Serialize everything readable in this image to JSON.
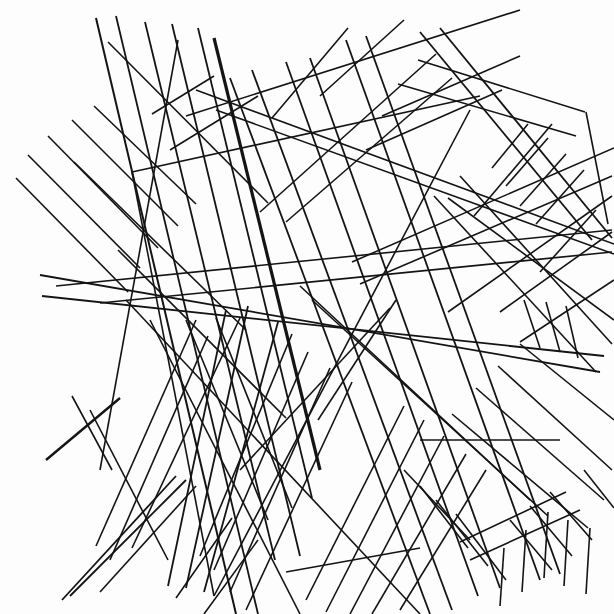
{
  "artwork": {
    "title": "Abstract Straight-Line Composition",
    "medium": "line-drawing",
    "width": 614,
    "height": 614,
    "background_color": "#fdfdfd",
    "stroke_color": "#141414",
    "description": "Dense abstract composition of straight black line segments forming overlapping parallel bundles at many angles on a white field."
  },
  "chart_data": {
    "type": "scatter",
    "xlabel": "",
    "ylabel": "",
    "xlim": [
      0,
      614
    ],
    "ylim": [
      0,
      614
    ],
    "grid": false,
    "legend": "none",
    "segments": [
      {
        "id": "s001",
        "x1": 108,
        "y1": 42,
        "x2": 268,
        "y2": 203,
        "w": 1.6,
        "group": "ul-fan"
      },
      {
        "id": "s002",
        "x1": 94,
        "y1": 106,
        "x2": 196,
        "y2": 204,
        "w": 1.6,
        "group": "ul-fan"
      },
      {
        "id": "s003",
        "x1": 72,
        "y1": 120,
        "x2": 178,
        "y2": 226,
        "w": 1.6,
        "group": "ul-fan"
      },
      {
        "id": "s004",
        "x1": 48,
        "y1": 136,
        "x2": 158,
        "y2": 248,
        "w": 1.6,
        "group": "ul-fan"
      },
      {
        "id": "s005",
        "x1": 28,
        "y1": 155,
        "x2": 140,
        "y2": 268,
        "w": 1.6,
        "group": "ul-fan"
      },
      {
        "id": "s006",
        "x1": 16,
        "y1": 178,
        "x2": 128,
        "y2": 292,
        "w": 1.6,
        "group": "ul-fan"
      },
      {
        "id": "s010",
        "x1": 96,
        "y1": 18,
        "x2": 236,
        "y2": 614,
        "w": 2.0,
        "group": "ul-bundle"
      },
      {
        "id": "s011",
        "x1": 116,
        "y1": 16,
        "x2": 258,
        "y2": 614,
        "w": 1.8,
        "group": "ul-bundle"
      },
      {
        "id": "s012",
        "x1": 145,
        "y1": 22,
        "x2": 275,
        "y2": 560,
        "w": 1.8,
        "group": "ul-bundle"
      },
      {
        "id": "s013",
        "x1": 172,
        "y1": 24,
        "x2": 300,
        "y2": 556,
        "w": 1.8,
        "group": "ul-bundle"
      },
      {
        "id": "s014",
        "x1": 198,
        "y1": 28,
        "x2": 312,
        "y2": 498,
        "w": 1.8,
        "group": "ul-bundle"
      },
      {
        "id": "s015",
        "x1": 214,
        "y1": 38,
        "x2": 320,
        "y2": 470,
        "w": 3.2,
        "group": "ul-bundle-thick"
      },
      {
        "id": "s016",
        "x1": 178,
        "y1": 40,
        "x2": 100,
        "y2": 470,
        "w": 1.6,
        "group": "ul-cross"
      },
      {
        "id": "s020",
        "x1": 152,
        "y1": 114,
        "x2": 214,
        "y2": 76,
        "w": 1.6,
        "group": "ul-short"
      },
      {
        "id": "s021",
        "x1": 170,
        "y1": 150,
        "x2": 258,
        "y2": 96,
        "w": 1.6,
        "group": "ul-short"
      },
      {
        "id": "s030",
        "x1": 40,
        "y1": 275,
        "x2": 600,
        "y2": 372,
        "w": 1.8,
        "group": "wide-band-top"
      },
      {
        "id": "s031",
        "x1": 42,
        "y1": 296,
        "x2": 604,
        "y2": 356,
        "w": 1.8,
        "group": "wide-band-bot"
      },
      {
        "id": "s032",
        "x1": 56,
        "y1": 286,
        "x2": 612,
        "y2": 230,
        "w": 1.6,
        "group": "band-b-top"
      },
      {
        "id": "s033",
        "x1": 100,
        "y1": 303,
        "x2": 612,
        "y2": 252,
        "w": 1.6,
        "group": "band-b-bot"
      },
      {
        "id": "s040",
        "x1": 132,
        "y1": 172,
        "x2": 214,
        "y2": 596,
        "w": 1.6,
        "group": "kite"
      },
      {
        "id": "s041",
        "x1": 132,
        "y1": 172,
        "x2": 480,
        "y2": 96,
        "w": 1.6,
        "group": "kite"
      },
      {
        "id": "s042",
        "x1": 214,
        "y1": 596,
        "x2": 470,
        "y2": 110,
        "w": 1.6,
        "group": "kite"
      },
      {
        "id": "s050",
        "x1": 230,
        "y1": 78,
        "x2": 430,
        "y2": 614,
        "w": 1.8,
        "group": "center-bundle"
      },
      {
        "id": "s051",
        "x1": 252,
        "y1": 70,
        "x2": 452,
        "y2": 610,
        "w": 1.8,
        "group": "center-bundle"
      },
      {
        "id": "s052",
        "x1": 286,
        "y1": 62,
        "x2": 478,
        "y2": 596,
        "w": 1.8,
        "group": "center-bundle"
      },
      {
        "id": "s053",
        "x1": 310,
        "y1": 58,
        "x2": 500,
        "y2": 588,
        "w": 1.8,
        "group": "center-bundle"
      },
      {
        "id": "s054",
        "x1": 346,
        "y1": 40,
        "x2": 540,
        "y2": 580,
        "w": 1.8,
        "group": "center-bundle"
      },
      {
        "id": "s055",
        "x1": 366,
        "y1": 36,
        "x2": 560,
        "y2": 574,
        "w": 1.8,
        "group": "center-bundle"
      },
      {
        "id": "s060",
        "x1": 272,
        "y1": 118,
        "x2": 348,
        "y2": 28,
        "w": 1.6,
        "group": "cross-right"
      },
      {
        "id": "s061",
        "x1": 320,
        "y1": 96,
        "x2": 404,
        "y2": 20,
        "w": 1.6,
        "group": "cross-right"
      },
      {
        "id": "s070",
        "x1": 196,
        "y1": 90,
        "x2": 614,
        "y2": 244,
        "w": 1.6,
        "group": "long-diag-a"
      },
      {
        "id": "s071",
        "x1": 216,
        "y1": 110,
        "x2": 614,
        "y2": 254,
        "w": 1.6,
        "group": "long-diag-a"
      },
      {
        "id": "s072",
        "x1": 186,
        "y1": 116,
        "x2": 520,
        "y2": 10,
        "w": 1.6,
        "group": "long-diag-b"
      },
      {
        "id": "s080",
        "x1": 420,
        "y1": 32,
        "x2": 592,
        "y2": 240,
        "w": 1.8,
        "group": "rt-wedge"
      },
      {
        "id": "s081",
        "x1": 440,
        "y1": 28,
        "x2": 612,
        "y2": 238,
        "w": 1.8,
        "group": "rt-wedge"
      },
      {
        "id": "s082",
        "x1": 418,
        "y1": 60,
        "x2": 585,
        "y2": 112,
        "w": 1.6,
        "group": "rt-wedge"
      },
      {
        "id": "s083",
        "x1": 398,
        "y1": 84,
        "x2": 576,
        "y2": 136,
        "w": 1.6,
        "group": "rt-wedge"
      },
      {
        "id": "s084",
        "x1": 586,
        "y1": 112,
        "x2": 608,
        "y2": 224,
        "w": 1.6,
        "group": "rt-wedge"
      },
      {
        "id": "s090",
        "x1": 436,
        "y1": 54,
        "x2": 260,
        "y2": 212,
        "w": 1.6,
        "group": "rt-back"
      },
      {
        "id": "s091",
        "x1": 452,
        "y1": 78,
        "x2": 286,
        "y2": 222,
        "w": 1.6,
        "group": "rt-back"
      },
      {
        "id": "s100",
        "x1": 528,
        "y1": 124,
        "x2": 492,
        "y2": 168,
        "w": 1.6,
        "group": "rt-comb"
      },
      {
        "id": "s101",
        "x1": 548,
        "y1": 138,
        "x2": 506,
        "y2": 186,
        "w": 1.6,
        "group": "rt-comb"
      },
      {
        "id": "s102",
        "x1": 566,
        "y1": 154,
        "x2": 520,
        "y2": 206,
        "w": 1.6,
        "group": "rt-comb"
      },
      {
        "id": "s103",
        "x1": 584,
        "y1": 170,
        "x2": 536,
        "y2": 224,
        "w": 1.6,
        "group": "rt-comb"
      },
      {
        "id": "s104",
        "x1": 552,
        "y1": 124,
        "x2": 474,
        "y2": 216,
        "w": 1.6,
        "group": "rt-comb"
      },
      {
        "id": "s110",
        "x1": 448,
        "y1": 198,
        "x2": 614,
        "y2": 320,
        "w": 1.6,
        "group": "rt-x"
      },
      {
        "id": "s111",
        "x1": 612,
        "y1": 196,
        "x2": 448,
        "y2": 312,
        "w": 1.6,
        "group": "rt-x"
      },
      {
        "id": "s112",
        "x1": 596,
        "y1": 210,
        "x2": 540,
        "y2": 272,
        "w": 1.6,
        "group": "rt-x"
      },
      {
        "id": "s120",
        "x1": 352,
        "y1": 262,
        "x2": 614,
        "y2": 148,
        "w": 1.6,
        "group": "mid-right-up"
      },
      {
        "id": "s121",
        "x1": 360,
        "y1": 284,
        "x2": 612,
        "y2": 176,
        "w": 1.6,
        "group": "mid-right-up"
      },
      {
        "id": "s130",
        "x1": 300,
        "y1": 286,
        "x2": 530,
        "y2": 500,
        "w": 1.6,
        "group": "mid-fan"
      },
      {
        "id": "s131",
        "x1": 312,
        "y1": 300,
        "x2": 548,
        "y2": 516,
        "w": 1.6,
        "group": "mid-fan"
      },
      {
        "id": "s140",
        "x1": 126,
        "y1": 300,
        "x2": 420,
        "y2": 614,
        "w": 1.6,
        "group": "lowleft-fan"
      },
      {
        "id": "s141",
        "x1": 150,
        "y1": 320,
        "x2": 300,
        "y2": 614,
        "w": 1.6,
        "group": "lowleft-fan"
      },
      {
        "id": "s142",
        "x1": 186,
        "y1": 320,
        "x2": 268,
        "y2": 520,
        "w": 1.6,
        "group": "lowleft-fan"
      },
      {
        "id": "s143",
        "x1": 216,
        "y1": 318,
        "x2": 292,
        "y2": 508,
        "w": 1.6,
        "group": "lowleft-fan"
      },
      {
        "id": "s150",
        "x1": 208,
        "y1": 336,
        "x2": 110,
        "y2": 560,
        "w": 1.6,
        "group": "ll-down"
      },
      {
        "id": "s151",
        "x1": 196,
        "y1": 320,
        "x2": 96,
        "y2": 546,
        "w": 1.6,
        "group": "ll-down"
      },
      {
        "id": "s152",
        "x1": 240,
        "y1": 318,
        "x2": 132,
        "y2": 548,
        "w": 1.6,
        "group": "ll-down"
      },
      {
        "id": "s160",
        "x1": 226,
        "y1": 310,
        "x2": 168,
        "y2": 586,
        "w": 1.8,
        "group": "ll-vert"
      },
      {
        "id": "s161",
        "x1": 248,
        "y1": 306,
        "x2": 186,
        "y2": 588,
        "w": 1.8,
        "group": "ll-vert"
      },
      {
        "id": "s162",
        "x1": 278,
        "y1": 322,
        "x2": 204,
        "y2": 592,
        "w": 1.8,
        "group": "ll-vert"
      },
      {
        "id": "s170",
        "x1": 292,
        "y1": 334,
        "x2": 200,
        "y2": 556,
        "w": 1.6,
        "group": "ll-sheaf"
      },
      {
        "id": "s171",
        "x1": 308,
        "y1": 352,
        "x2": 214,
        "y2": 570,
        "w": 1.6,
        "group": "ll-sheaf"
      },
      {
        "id": "s172",
        "x1": 330,
        "y1": 368,
        "x2": 230,
        "y2": 592,
        "w": 1.6,
        "group": "ll-sheaf"
      },
      {
        "id": "s173",
        "x1": 352,
        "y1": 382,
        "x2": 246,
        "y2": 610,
        "w": 1.6,
        "group": "ll-sheaf"
      },
      {
        "id": "s180",
        "x1": 318,
        "y1": 420,
        "x2": 396,
        "y2": 300,
        "w": 1.6,
        "group": "mid-short"
      },
      {
        "id": "s181",
        "x1": 240,
        "y1": 470,
        "x2": 390,
        "y2": 308,
        "w": 1.6,
        "group": "mid-short"
      },
      {
        "id": "s190",
        "x1": 404,
        "y1": 406,
        "x2": 306,
        "y2": 600,
        "w": 1.6,
        "group": "lowmid-fan"
      },
      {
        "id": "s191",
        "x1": 424,
        "y1": 420,
        "x2": 326,
        "y2": 612,
        "w": 1.6,
        "group": "lowmid-fan"
      },
      {
        "id": "s192",
        "x1": 444,
        "y1": 436,
        "x2": 350,
        "y2": 614,
        "w": 1.6,
        "group": "lowmid-fan"
      },
      {
        "id": "s193",
        "x1": 466,
        "y1": 454,
        "x2": 372,
        "y2": 614,
        "w": 1.6,
        "group": "lowmid-fan"
      },
      {
        "id": "s194",
        "x1": 486,
        "y1": 470,
        "x2": 400,
        "y2": 610,
        "w": 1.6,
        "group": "lowmid-fan"
      },
      {
        "id": "s200",
        "x1": 420,
        "y1": 440,
        "x2": 560,
        "y2": 440,
        "w": 1.6,
        "group": "lowmid-cross"
      },
      {
        "id": "s201",
        "x1": 404,
        "y1": 470,
        "x2": 470,
        "y2": 540,
        "w": 1.6,
        "group": "lowmid-cross"
      },
      {
        "id": "s202",
        "x1": 420,
        "y1": 486,
        "x2": 468,
        "y2": 548,
        "w": 1.6,
        "group": "lowmid-cross"
      },
      {
        "id": "s203",
        "x1": 436,
        "y1": 500,
        "x2": 488,
        "y2": 566,
        "w": 1.6,
        "group": "lowmid-cross"
      },
      {
        "id": "s204",
        "x1": 456,
        "y1": 514,
        "x2": 506,
        "y2": 580,
        "w": 1.6,
        "group": "lowmid-cross"
      },
      {
        "id": "s210",
        "x1": 286,
        "y1": 572,
        "x2": 420,
        "y2": 548,
        "w": 1.6,
        "group": "low-horizontal"
      },
      {
        "id": "s220",
        "x1": 498,
        "y1": 366,
        "x2": 612,
        "y2": 470,
        "w": 1.6,
        "group": "lr-diag"
      },
      {
        "id": "s221",
        "x1": 476,
        "y1": 388,
        "x2": 604,
        "y2": 500,
        "w": 1.6,
        "group": "lr-diag"
      },
      {
        "id": "s222",
        "x1": 452,
        "y1": 414,
        "x2": 588,
        "y2": 528,
        "w": 1.6,
        "group": "lr-diag"
      },
      {
        "id": "s223",
        "x1": 520,
        "y1": 344,
        "x2": 614,
        "y2": 420,
        "w": 1.6,
        "group": "lr-diag"
      },
      {
        "id": "s230",
        "x1": 540,
        "y1": 348,
        "x2": 524,
        "y2": 300,
        "w": 1.6,
        "group": "lr-comb"
      },
      {
        "id": "s231",
        "x1": 560,
        "y1": 352,
        "x2": 546,
        "y2": 302,
        "w": 1.6,
        "group": "lr-comb"
      },
      {
        "id": "s232",
        "x1": 578,
        "y1": 358,
        "x2": 566,
        "y2": 306,
        "w": 1.6,
        "group": "lr-comb"
      },
      {
        "id": "s233",
        "x1": 520,
        "y1": 342,
        "x2": 614,
        "y2": 280,
        "w": 1.6,
        "group": "lr-comb"
      },
      {
        "id": "s234",
        "x1": 500,
        "y1": 312,
        "x2": 612,
        "y2": 232,
        "w": 1.6,
        "group": "lr-comb"
      },
      {
        "id": "s240",
        "x1": 550,
        "y1": 492,
        "x2": 592,
        "y2": 540,
        "w": 1.6,
        "group": "lr-low-comb"
      },
      {
        "id": "s241",
        "x1": 530,
        "y1": 506,
        "x2": 572,
        "y2": 556,
        "w": 1.6,
        "group": "lr-low-comb"
      },
      {
        "id": "s242",
        "x1": 510,
        "y1": 520,
        "x2": 552,
        "y2": 570,
        "w": 1.6,
        "group": "lr-low-comb"
      },
      {
        "id": "s243",
        "x1": 584,
        "y1": 470,
        "x2": 614,
        "y2": 508,
        "w": 1.6,
        "group": "lr-low-comb"
      },
      {
        "id": "s244",
        "x1": 568,
        "y1": 520,
        "x2": 564,
        "y2": 586,
        "w": 1.6,
        "group": "lr-low-comb"
      },
      {
        "id": "s245",
        "x1": 590,
        "y1": 528,
        "x2": 586,
        "y2": 594,
        "w": 1.6,
        "group": "lr-low-comb"
      },
      {
        "id": "s246",
        "x1": 548,
        "y1": 512,
        "x2": 544,
        "y2": 578,
        "w": 1.6,
        "group": "lr-low-comb"
      },
      {
        "id": "s247",
        "x1": 526,
        "y1": 530,
        "x2": 522,
        "y2": 592,
        "w": 1.6,
        "group": "lr-low-comb"
      },
      {
        "id": "s248",
        "x1": 504,
        "y1": 548,
        "x2": 500,
        "y2": 606,
        "w": 1.6,
        "group": "lr-low-comb"
      },
      {
        "id": "s250",
        "x1": 460,
        "y1": 542,
        "x2": 566,
        "y2": 492,
        "w": 1.6,
        "group": "low-wedge"
      },
      {
        "id": "s251",
        "x1": 470,
        "y1": 560,
        "x2": 580,
        "y2": 510,
        "w": 1.6,
        "group": "low-wedge"
      },
      {
        "id": "s260",
        "x1": 62,
        "y1": 600,
        "x2": 176,
        "y2": 476,
        "w": 1.8,
        "group": "ll-corner"
      },
      {
        "id": "s261",
        "x1": 70,
        "y1": 596,
        "x2": 186,
        "y2": 480,
        "w": 1.8,
        "group": "ll-corner"
      },
      {
        "id": "s262",
        "x1": 100,
        "y1": 592,
        "x2": 196,
        "y2": 486,
        "w": 1.6,
        "group": "ll-corner"
      },
      {
        "id": "s263",
        "x1": 46,
        "y1": 460,
        "x2": 120,
        "y2": 398,
        "w": 2.4,
        "group": "ll-corner-thick"
      },
      {
        "id": "s270",
        "x1": 90,
        "y1": 410,
        "x2": 168,
        "y2": 560,
        "w": 1.6,
        "group": "ll-up"
      },
      {
        "id": "s271",
        "x1": 72,
        "y1": 396,
        "x2": 112,
        "y2": 470,
        "w": 1.6,
        "group": "ll-up"
      },
      {
        "id": "s280",
        "x1": 258,
        "y1": 540,
        "x2": 204,
        "y2": 614,
        "w": 1.6,
        "group": "low-small"
      },
      {
        "id": "s281",
        "x1": 232,
        "y1": 518,
        "x2": 176,
        "y2": 598,
        "w": 1.6,
        "group": "low-small"
      },
      {
        "id": "s290",
        "x1": 460,
        "y1": 176,
        "x2": 612,
        "y2": 344,
        "w": 1.6,
        "group": "rt-long"
      },
      {
        "id": "s291",
        "x1": 434,
        "y1": 196,
        "x2": 596,
        "y2": 372,
        "w": 1.6,
        "group": "rt-long"
      },
      {
        "id": "s300",
        "x1": 382,
        "y1": 116,
        "x2": 520,
        "y2": 56,
        "w": 1.6,
        "group": "top-mid"
      },
      {
        "id": "s301",
        "x1": 366,
        "y1": 150,
        "x2": 502,
        "y2": 90,
        "w": 1.6,
        "group": "top-mid"
      },
      {
        "id": "s310",
        "x1": 74,
        "y1": 162,
        "x2": 246,
        "y2": 330,
        "w": 1.6,
        "group": "ul-extra"
      },
      {
        "id": "s311",
        "x1": 118,
        "y1": 250,
        "x2": 286,
        "y2": 418,
        "w": 1.6,
        "group": "ul-extra"
      }
    ]
  }
}
